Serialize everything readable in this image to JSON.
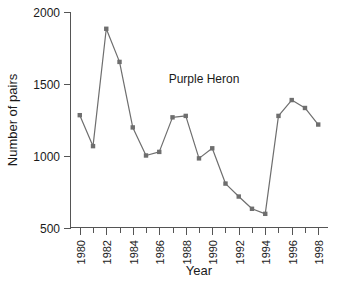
{
  "chart_data": {
    "type": "line",
    "title": "",
    "annotation": "Purple Heron",
    "xlabel": "Year",
    "ylabel": "Number of pairs",
    "x": [
      1980,
      1981,
      1982,
      1983,
      1984,
      1985,
      1986,
      1987,
      1988,
      1989,
      1990,
      1991,
      1992,
      1993,
      1994,
      1995,
      1996,
      1997,
      1998
    ],
    "values": [
      1280,
      1065,
      1880,
      1650,
      1195,
      1000,
      1025,
      1265,
      1275,
      980,
      1050,
      805,
      715,
      630,
      595,
      1275,
      1385,
      1330,
      1215
    ],
    "series": [
      {
        "name": "Purple Heron",
        "values": [
          1280,
          1065,
          1880,
          1650,
          1195,
          1000,
          1025,
          1265,
          1275,
          980,
          1050,
          805,
          715,
          630,
          595,
          1275,
          1385,
          1330,
          1215
        ]
      }
    ],
    "xlim": [
      1979.3,
      1998.7
    ],
    "ylim": [
      500,
      2000
    ],
    "xtick_labels": [
      "1980",
      "1982",
      "1984",
      "1986",
      "1988",
      "1990",
      "1992",
      "1994",
      "1996",
      "1998"
    ],
    "xtick_values": [
      1980,
      1982,
      1984,
      1986,
      1988,
      1990,
      1992,
      1994,
      1996,
      1998
    ],
    "xminor_tick_values": [
      1981,
      1983,
      1985,
      1987,
      1989,
      1991,
      1993,
      1995,
      1997
    ],
    "ytick_labels": [
      "500",
      "1000",
      "1500",
      "2000"
    ],
    "ytick_values": [
      500,
      1000,
      1500,
      2000
    ],
    "grid": false,
    "legend": "none",
    "xtick_label_rotation": -90,
    "marker": "square",
    "line_color": "#6e6e6e",
    "marker_color": "#6e6e6e",
    "axis_color": "#555555",
    "background_color": "#ffffff"
  },
  "axes": {
    "y_label": "Number of pairs",
    "x_label": "Year"
  },
  "annotations": {
    "species": "Purple Heron"
  },
  "y_ticks": [
    {
      "label": "2000",
      "value": 2000
    },
    {
      "label": "1500",
      "value": 1500
    },
    {
      "label": "1000",
      "value": 1000
    },
    {
      "label": "500",
      "value": 500
    }
  ],
  "x_ticks": [
    {
      "label": "1980",
      "value": 1980
    },
    {
      "label": "1982",
      "value": 1982
    },
    {
      "label": "1984",
      "value": 1984
    },
    {
      "label": "1986",
      "value": 1986
    },
    {
      "label": "1988",
      "value": 1988
    },
    {
      "label": "1990",
      "value": 1990
    },
    {
      "label": "1992",
      "value": 1992
    },
    {
      "label": "1994",
      "value": 1994
    },
    {
      "label": "1996",
      "value": 1996
    },
    {
      "label": "1998",
      "value": 1998
    }
  ]
}
